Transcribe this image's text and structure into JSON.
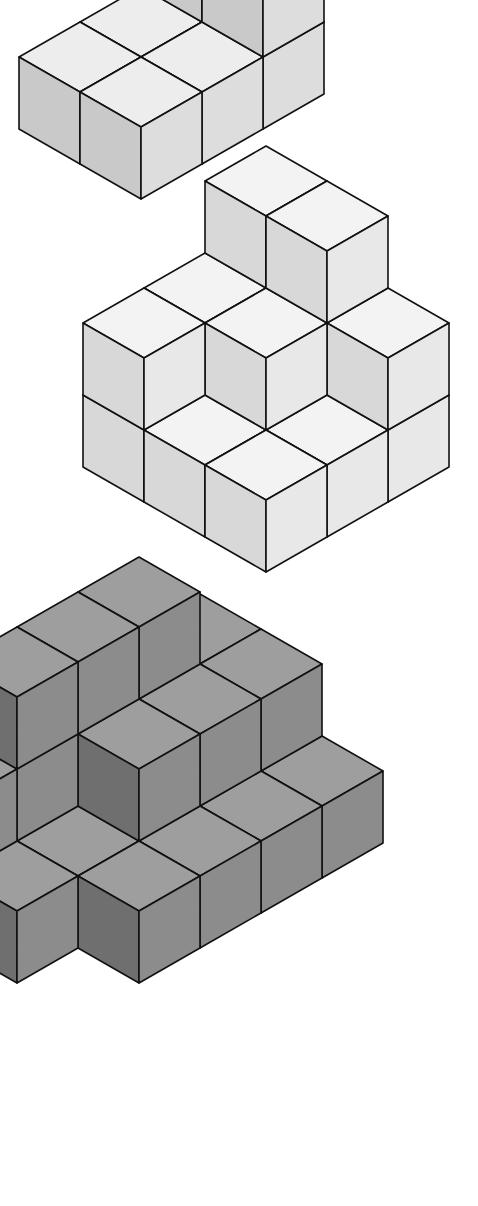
{
  "figures": [
    {
      "label": "(a)",
      "shade": "light",
      "colors": {
        "top": "#ededed",
        "left": "#c9c9c9",
        "right": "#dddddd"
      }
    },
    {
      "label": "(c)",
      "shade": "lighter",
      "colors": {
        "top": "#f3f3f3",
        "left": "#d8d8d8",
        "right": "#e8e8e8"
      }
    },
    {
      "label": "(e)",
      "shade": "dark",
      "colors": {
        "top": "#9e9e9e",
        "left": "#6f6f6f",
        "right": "#8c8c8c"
      }
    }
  ],
  "geometry": {
    "a": 61,
    "b": 35,
    "h": 72
  }
}
